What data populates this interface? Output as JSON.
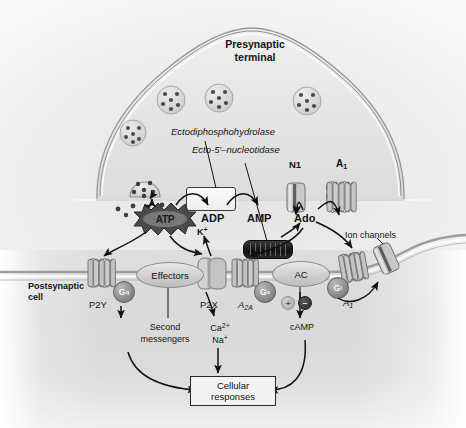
{
  "figure": {
    "type": "biological-pathway-diagram"
  },
  "regions": {
    "presynaptic_label": "Presynaptic\nterminal",
    "presynaptic_line1": "Presynaptic",
    "presynaptic_line2": "terminal",
    "postsynaptic_line1": "Postsynaptic",
    "postsynaptic_line2": "cell"
  },
  "enzymes": {
    "ectodiphosphohydrolase": "Ectodiphosphohydrolase",
    "ecto5nucleotidase": "Ecto-5′–nucleotidase"
  },
  "molecules": {
    "atp": "ATP",
    "adp": "ADP",
    "amp": "AMP",
    "ado": "Ado"
  },
  "presynaptic_receptors": [
    {
      "name": "N1",
      "label": "N1",
      "kind": "transporter"
    },
    {
      "name": "A1",
      "label": "A",
      "subscript": "1",
      "kind": "gpcr"
    }
  ],
  "postsynaptic_receptors": [
    {
      "name": "P2Y",
      "label": "P2Y",
      "subscript": "",
      "g_protein": "G",
      "g_subscript": "q",
      "kind": "gpcr"
    },
    {
      "name": "P2X",
      "label": "P2X",
      "subscript": "",
      "g_protein": "",
      "g_subscript": "",
      "kind": "ion-channel"
    },
    {
      "name": "A2A",
      "label": "A",
      "subscript": "2A",
      "g_protein": "G",
      "g_subscript": "s",
      "kind": "gpcr"
    },
    {
      "name": "A1",
      "label": "A",
      "subscript": "1",
      "g_protein": "G",
      "g_subscript": "i",
      "kind": "gpcr"
    }
  ],
  "effectors_label": "Effectors",
  "ac_label": "AC",
  "ion_channels_label": "Ion channels",
  "ions": {
    "potassium": "K",
    "potassium_sup": "+",
    "calcium": "Ca",
    "calcium_sup": "2+",
    "sodium": "Na",
    "sodium_sup": "+"
  },
  "downstream": {
    "second_messengers_line1": "Second",
    "second_messengers_line2": "messengers",
    "camp": "cAMP",
    "cellular_line1": "Cellular",
    "cellular_line2": "responses"
  },
  "signs": {
    "plus": "+",
    "minus": "−"
  },
  "colors": {
    "ink": "#141414",
    "membrane_stroke": "#9a9a9a",
    "cell_fill": "#e4e4e4",
    "postsynaptic_fill": "#d9d9d9",
    "protein_fill": "#c9c9c9",
    "protein_stroke": "#7d7d7d",
    "gprotein_fill": "#8a8a8a",
    "enzyme_dark": "#111111",
    "box_fill": "#f2f2f2",
    "background": "#ffffff"
  }
}
